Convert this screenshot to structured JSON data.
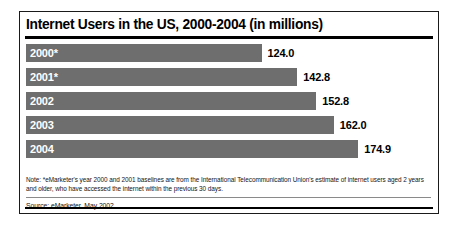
{
  "figure": {
    "title": "Internet Users in the US, 2000-2004 (in millions)",
    "note": "Note: *eMarketer's year 2000 and 2001 baselines are from the International Telecommunication Union's estimate of internet users aged 2 years and older, who have accessed the internet within the previous 30 days.",
    "source": "Source: eMarketer, May 2002"
  },
  "chart_data": {
    "type": "bar",
    "orientation": "horizontal",
    "title": "Internet Users in the US, 2000-2004 (in millions)",
    "xlabel": "",
    "ylabel": "",
    "categories": [
      "2000*",
      "2001*",
      "2002",
      "2003",
      "2004"
    ],
    "values": [
      124.0,
      142.8,
      152.8,
      162.0,
      174.9
    ],
    "value_labels": [
      "124.0",
      "142.8",
      "152.8",
      "162.0",
      "174.9"
    ],
    "xlim": [
      0,
      200
    ],
    "grid": false,
    "legend": false,
    "bar_color": "#6e6e6e",
    "label_color": "#ffffff",
    "value_color": "#000000",
    "note": "Note: *eMarketer's year 2000 and 2001 baselines are from the International Telecommunication Union's estimate of internet users aged 2 years and older, who have accessed the internet within the previous 30 days.",
    "source": "Source: eMarketer, May 2002"
  }
}
